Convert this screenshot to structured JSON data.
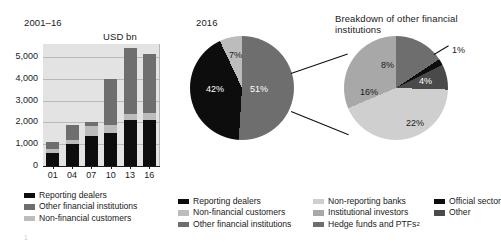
{
  "panels": {
    "left_title": "2001–16",
    "left_unit": "USD bn",
    "mid_title": "2016",
    "right_title": "Breakdown of other financial institutions"
  },
  "footnote": "1",
  "colors": {
    "reporting_dealers": "#0d0d0d",
    "other_financial_institutions": "#6e6e6e",
    "non_financial_customers": "#bcbcbc",
    "non_reporting_banks": "#cfcfcf",
    "institutional_investors": "#a8a8a8",
    "hedge_funds_ptfs": "#6e6e6e",
    "official_sector": "#0d0d0d",
    "other": "#4a4a4a",
    "plot_background": "#e3e3e3",
    "gridline": "#b9b9b9"
  },
  "legends": {
    "bar": [
      {
        "label": "Reporting dealers",
        "color": "#0d0d0d"
      },
      {
        "label": "Other financial institutions",
        "color": "#6e6e6e"
      },
      {
        "label": "Non-financial customers",
        "color": "#bcbcbc"
      }
    ],
    "pie_col_a": [
      {
        "label": "Reporting dealers",
        "color": "#0d0d0d"
      },
      {
        "label": "Non-financial customers",
        "color": "#bcbcbc"
      },
      {
        "label": "Other financial institutions",
        "color": "#6e6e6e"
      }
    ],
    "pie_col_b": [
      {
        "label": "Non-reporting banks",
        "color": "#cfcfcf"
      },
      {
        "label": "Institutional investors",
        "color": "#a8a8a8"
      },
      {
        "label": "Hedge funds and PTFs",
        "color": "#6e6e6e",
        "superscript": "2"
      }
    ],
    "pie_col_c": [
      {
        "label": "Official sector",
        "color": "#0d0d0d"
      },
      {
        "label": "Other",
        "color": "#4a4a4a"
      }
    ]
  },
  "chart_data": [
    {
      "type": "bar",
      "title": "2001–16",
      "subtype": "stacked",
      "xlabel": "",
      "ylabel": "USD bn",
      "ylim": [
        0,
        5600
      ],
      "yticks": [
        0,
        1000,
        2000,
        3000,
        4000,
        5000
      ],
      "ytick_labels": [
        "0",
        "1,000",
        "2,000",
        "3,000",
        "4,000",
        "5,000"
      ],
      "grid": true,
      "legend_position": "below",
      "categories": [
        "01",
        "04",
        "07",
        "10",
        "13",
        "16"
      ],
      "series": [
        {
          "name": "Reporting dealers",
          "color": "#0d0d0d",
          "values": [
            600,
            1000,
            1400,
            1500,
            2100,
            2100
          ]
        },
        {
          "name": "Non-financial customers",
          "color": "#bcbcbc",
          "values": [
            170,
            200,
            430,
            400,
            300,
            330
          ]
        },
        {
          "name": "Other financial institutions",
          "color": "#6e6e6e",
          "values": [
            310,
            700,
            170,
            2100,
            3000,
            2700
          ]
        }
      ],
      "totals": [
        1080,
        1900,
        2000,
        4000,
        5400,
        5130
      ]
    },
    {
      "type": "pie",
      "title": "2016",
      "labels": [
        "Reporting dealers",
        "Non-financial customers",
        "Other financial institutions"
      ],
      "values": [
        42,
        7,
        51
      ],
      "value_labels": [
        "42%",
        "7%",
        "51%"
      ],
      "colors": [
        "#0d0d0d",
        "#bcbcbc",
        "#6e6e6e"
      ],
      "legend_position": "below"
    },
    {
      "type": "pie",
      "title": "Breakdown of other financial institutions",
      "labels": [
        "Non-reporting banks",
        "Institutional investors",
        "Hedge funds and PTFs",
        "Official sector",
        "Other"
      ],
      "values": [
        22,
        16,
        8,
        1,
        4
      ],
      "value_labels": [
        "22%",
        "16%",
        "8%",
        "1%",
        "4%"
      ],
      "colors": [
        "#cfcfcf",
        "#a8a8a8",
        "#6e6e6e",
        "#0d0d0d",
        "#4a4a4a"
      ],
      "legend_position": "below"
    }
  ]
}
